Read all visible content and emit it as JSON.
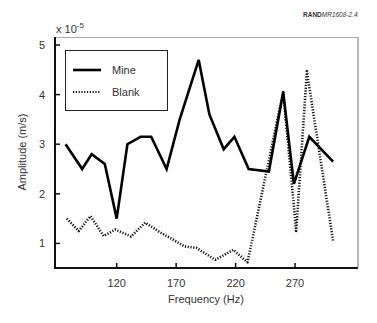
{
  "credit": {
    "bold": "RAND",
    "italic": "MR1608-2.4"
  },
  "chart_data": {
    "type": "line",
    "title": "",
    "xlabel": "Frequency (Hz)",
    "ylabel": "Amplitude (m/s)",
    "y_multiplier": "x 10",
    "y_multiplier_exp": "-5",
    "xticks": [
      120,
      170,
      220,
      270
    ],
    "yticks": [
      1,
      2,
      3,
      4,
      5
    ],
    "xlim": [
      75,
      310
    ],
    "ylim": [
      0.5,
      5.15
    ],
    "grid": false,
    "legend_position": "upper left",
    "series": [
      {
        "name": "Mine",
        "style": "solid",
        "x": [
          77,
          91,
          99,
          110,
          120,
          129,
          140,
          149,
          162,
          173,
          189,
          198,
          210,
          219,
          231,
          248,
          260,
          269,
          282,
          302
        ],
        "values": [
          3.0,
          2.5,
          2.8,
          2.6,
          1.5,
          3.0,
          3.15,
          3.15,
          2.5,
          3.5,
          4.7,
          3.6,
          2.9,
          3.15,
          2.5,
          2.45,
          4.05,
          2.2,
          3.15,
          2.65
        ]
      },
      {
        "name": "Blank",
        "style": "dotted",
        "x": [
          78,
          88,
          98,
          109,
          119,
          132,
          144,
          156,
          167,
          177,
          187,
          203,
          218,
          230,
          260,
          271,
          280,
          302
        ],
        "values": [
          1.5,
          1.25,
          1.55,
          1.15,
          1.28,
          1.14,
          1.42,
          1.23,
          1.08,
          0.94,
          0.91,
          0.67,
          0.87,
          0.62,
          4.05,
          1.25,
          4.47,
          1.05
        ]
      }
    ]
  }
}
